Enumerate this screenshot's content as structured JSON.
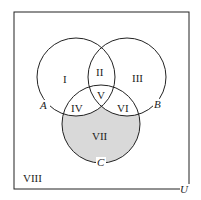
{
  "diagram": {
    "type": "venn",
    "universe_label": "U",
    "sets": [
      {
        "name": "A",
        "label": "A"
      },
      {
        "name": "B",
        "label": "B"
      },
      {
        "name": "C",
        "label": "C"
      }
    ],
    "regions": {
      "r1": "I",
      "r2": "II",
      "r3": "III",
      "r4": "IV",
      "r5": "V",
      "r6": "VI",
      "r7": "VII",
      "r8": "VIII"
    },
    "shaded_region": "VII",
    "shade_color": "#d9d9d9",
    "line_color": "#222222"
  }
}
